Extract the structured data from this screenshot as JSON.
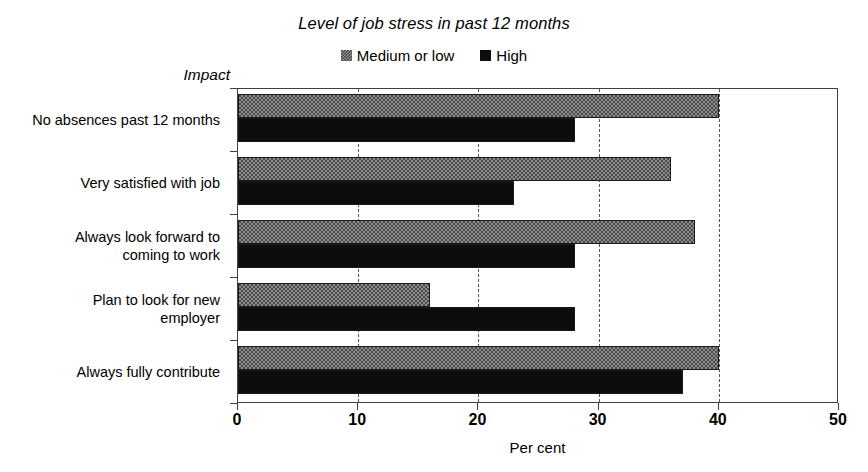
{
  "chart_data": {
    "type": "bar",
    "orientation": "horizontal",
    "title": "Level of job stress in past 12 months",
    "xlabel": "Per cent",
    "ylabel": "Impact",
    "xlim": [
      0,
      50
    ],
    "xticks": [
      0,
      10,
      20,
      30,
      40,
      50
    ],
    "grid": "vertical-dashed",
    "legend_position": "top-center",
    "categories": [
      "No absences past 12 months",
      "Very satisfied with job",
      "Always look forward to coming to work",
      "Plan to look for new employer",
      "Always fully contribute"
    ],
    "series": [
      {
        "name": "Medium or low",
        "color": "#4a4a4a",
        "values": [
          40,
          36,
          38,
          16,
          40
        ]
      },
      {
        "name": "High",
        "color": "#0d0d0d",
        "values": [
          28,
          23,
          28,
          28,
          37
        ]
      }
    ]
  },
  "labels": {
    "category_lines": [
      [
        "No absences past 12 months"
      ],
      [
        "Very satisfied with job"
      ],
      [
        "Always look forward to",
        "coming to work"
      ],
      [
        "Plan to look for new",
        "employer"
      ],
      [
        "Always fully contribute"
      ]
    ]
  }
}
